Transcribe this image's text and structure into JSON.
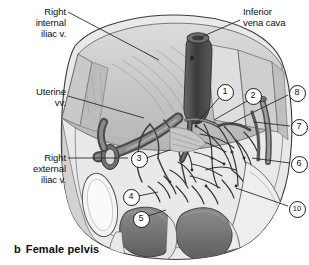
{
  "figure": {
    "caption_letter": "b",
    "caption_text": "Female pelvis"
  },
  "colors": {
    "ink": "#1a1a1a",
    "leader_line": "#2b2b2b",
    "body_wall_light": "#d8d8d8",
    "body_wall_mid": "#bdbdbd",
    "body_wall_dark": "#9a9a9a",
    "vessel_dark": "#4a4a4a",
    "organ_dark": "#6e6e6e",
    "bone_light": "#f2f2f2",
    "background": "#ffffff"
  },
  "labels": [
    {
      "id": "right-internal-iliac-vein",
      "text": "Right\ninternal\niliac v.",
      "align": "right",
      "x": 4,
      "y": 6,
      "width": 62,
      "leader": {
        "x1": 68,
        "y1": 12,
        "x2": 159,
        "y2": 60
      }
    },
    {
      "id": "inferior-vena-cava",
      "text": "Inferior\nvena cava",
      "align": "left",
      "x": 243,
      "y": 6,
      "width": 64,
      "leader": {
        "x1": 240,
        "y1": 20,
        "x2": 199,
        "y2": 38
      }
    },
    {
      "id": "uterine-veins",
      "text": "Uterine\nvv.",
      "align": "right",
      "x": 4,
      "y": 86,
      "width": 62,
      "leader": {
        "x1": 68,
        "y1": 96,
        "x2": 144,
        "y2": 118
      }
    },
    {
      "id": "right-external-iliac-vein",
      "text": "Right\nexternal\niliac v.",
      "align": "right",
      "x": 4,
      "y": 152,
      "width": 62,
      "leader": {
        "x1": 68,
        "y1": 158,
        "x2": 128,
        "y2": 158
      }
    }
  ],
  "markers": [
    {
      "id": "marker-1",
      "number": "1",
      "x": 224,
      "y": 91,
      "leader": {
        "x1": 219,
        "y1": 98,
        "x2": 196,
        "y2": 124
      }
    },
    {
      "id": "marker-2",
      "number": "2",
      "x": 252,
      "y": 95,
      "leader": {
        "x1": 247,
        "y1": 101,
        "x2": 214,
        "y2": 120
      }
    },
    {
      "id": "marker-3",
      "number": "3",
      "x": 138,
      "y": 158,
      "leader": {
        "x1": 146,
        "y1": 158,
        "x2": 170,
        "y2": 150
      }
    },
    {
      "id": "marker-4",
      "number": "4",
      "x": 130,
      "y": 196,
      "leader": {
        "x1": 138,
        "y1": 196,
        "x2": 158,
        "y2": 192
      }
    },
    {
      "id": "marker-5",
      "number": "5",
      "x": 140,
      "y": 218,
      "leader": {
        "x1": 148,
        "y1": 216,
        "x2": 166,
        "y2": 210
      }
    },
    {
      "id": "marker-6",
      "number": "6",
      "x": 298,
      "y": 163,
      "leader": {
        "x1": 290,
        "y1": 163,
        "x2": 252,
        "y2": 158
      }
    },
    {
      "id": "marker-7",
      "number": "7",
      "x": 298,
      "y": 126,
      "leader": {
        "x1": 290,
        "y1": 126,
        "x2": 254,
        "y2": 122
      }
    },
    {
      "id": "marker-8",
      "number": "8",
      "x": 296,
      "y": 92,
      "leader": {
        "x1": 288,
        "y1": 95,
        "x2": 230,
        "y2": 124
      }
    },
    {
      "id": "marker-10",
      "number": "10",
      "x": 296,
      "y": 208,
      "leader": {
        "x1": 288,
        "y1": 206,
        "x2": 236,
        "y2": 188
      }
    }
  ]
}
